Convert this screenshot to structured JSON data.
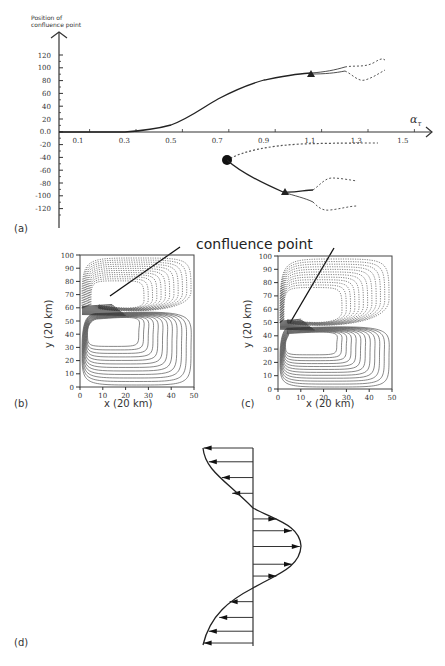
{
  "figure": {
    "panel_labels": [
      "(a)",
      "(b)",
      "(c)",
      "(d)"
    ],
    "annotation": "confluence point",
    "caption": ""
  },
  "chart_data": [
    {
      "panel": "(a)",
      "type": "line",
      "title": "",
      "ylabel": "Position of confluence point",
      "xlabel": "α_τ",
      "x_ticks": [
        "0.1",
        "0.3",
        "0.5",
        "0.7",
        "0.9",
        "1.1",
        "1.3",
        "1.5"
      ],
      "y_ticks": [
        "120",
        "100",
        "80",
        "60",
        "40",
        "20",
        "0.0",
        "-20",
        "-40",
        "-60",
        "-80",
        "-100",
        "-120"
      ],
      "xlim": [
        0.02,
        1.6
      ],
      "ylim": [
        -135,
        140
      ],
      "grid": false,
      "markers": [
        {
          "shape": "triangle",
          "x": 1.12,
          "y": 85
        },
        {
          "shape": "circle",
          "x": 0.74,
          "y": -43
        },
        {
          "shape": "triangle",
          "x": 0.99,
          "y": -93
        }
      ],
      "series": [
        {
          "name": "upper branch (solid)",
          "style": "solid",
          "x": [
            0.02,
            0.3,
            0.4,
            0.5,
            0.6,
            0.7,
            0.8,
            0.9,
            1.0,
            1.12
          ],
          "y": [
            0,
            0,
            3,
            10,
            25,
            45,
            60,
            72,
            80,
            85
          ]
        },
        {
          "name": "upper branch split (dashed)",
          "style": "dashed",
          "x": [
            1.12,
            1.25,
            1.3,
            1.35,
            1.38
          ],
          "y": [
            87,
            92,
            100,
            108,
            112
          ]
        },
        {
          "name": "upper branch split lower (dashed)",
          "style": "dashed",
          "x": [
            1.12,
            1.25,
            1.3,
            1.35,
            1.38
          ],
          "y": [
            84,
            90,
            85,
            88,
            95
          ]
        },
        {
          "name": "unstable branch (dashed)",
          "style": "dashed",
          "x": [
            0.74,
            0.85,
            1.0,
            1.2,
            1.4
          ],
          "y": [
            -43,
            -28,
            -20,
            -15,
            -15
          ]
        },
        {
          "name": "lower branch (solid)",
          "style": "solid",
          "x": [
            0.74,
            0.85,
            0.95,
            0.99,
            1.1
          ],
          "y": [
            -43,
            -65,
            -85,
            -93,
            -100
          ]
        },
        {
          "name": "lower branch split (dashed)",
          "style": "dashed",
          "x": [
            1.1,
            1.15,
            1.25,
            1.35
          ],
          "y": [
            -90,
            -80,
            -75,
            -77
          ]
        },
        {
          "name": "lower branch split low (dashed)",
          "style": "dashed",
          "x": [
            1.1,
            1.15,
            1.25,
            1.35
          ],
          "y": [
            -100,
            -110,
            -108,
            -105
          ]
        }
      ]
    },
    {
      "panel": "(b)",
      "type": "contour",
      "xlabel": "x (20 km)",
      "ylabel": "y (20 km)",
      "x_ticks": [
        "0",
        "10",
        "20",
        "30",
        "40",
        "50"
      ],
      "y_ticks": [
        "0",
        "10",
        "20",
        "30",
        "40",
        "50",
        "60",
        "70",
        "80",
        "90",
        "100"
      ],
      "xlim": [
        0,
        50
      ],
      "ylim": [
        0,
        100
      ],
      "confluence_point": {
        "x": 8,
        "y": 58
      }
    },
    {
      "panel": "(c)",
      "type": "contour",
      "xlabel": "x (20 km)",
      "ylabel": "y (20 km)",
      "x_ticks": [
        "0",
        "10",
        "20",
        "30",
        "40",
        "50"
      ],
      "y_ticks": [
        "0",
        "10",
        "20",
        "30",
        "40",
        "50",
        "60",
        "70",
        "80",
        "90",
        "100"
      ],
      "xlim": [
        0,
        50
      ],
      "ylim": [
        0,
        100
      ],
      "confluence_point": {
        "x": 4,
        "y": 48
      }
    },
    {
      "panel": "(d)",
      "type": "vector-profile",
      "description": "Wind stress profile: westward arrows at top and bottom, eastward arrows in middle",
      "arrows": [
        {
          "y": 0.0,
          "u": -0.95
        },
        {
          "y": 0.07,
          "u": -0.85
        },
        {
          "y": 0.15,
          "u": -0.6
        },
        {
          "y": 0.23,
          "u": -0.4
        },
        {
          "y": 0.36,
          "u": 0.45
        },
        {
          "y": 0.42,
          "u": 0.75
        },
        {
          "y": 0.5,
          "u": 0.9
        },
        {
          "y": 0.59,
          "u": 0.75
        },
        {
          "y": 0.65,
          "u": 0.45
        },
        {
          "y": 0.78,
          "u": -0.45
        },
        {
          "y": 0.86,
          "u": -0.65
        },
        {
          "y": 0.93,
          "u": -0.85
        },
        {
          "y": 0.99,
          "u": -0.95
        }
      ]
    }
  ]
}
